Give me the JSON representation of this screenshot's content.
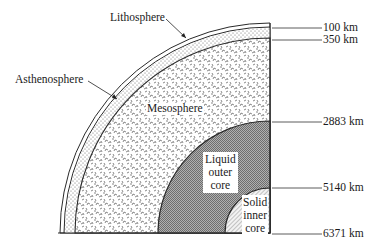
{
  "diagram": {
    "type": "earth-interior-cross-section-quadrant",
    "layers": [
      {
        "name": "Lithosphere",
        "depth_label": "100 km"
      },
      {
        "name": "Asthenosphere",
        "depth_label": "350 km"
      },
      {
        "name": "Mesosphere",
        "depth_label": "2883 km"
      },
      {
        "name": "Liquid outer core",
        "depth_label": "5140 km"
      },
      {
        "name": "Solid inner core",
        "depth_label": "6371 km"
      }
    ]
  },
  "labels": {
    "lithosphere": "Lithosphere",
    "asthenosphere": "Asthenosphere",
    "mesosphere": "Mesosphere",
    "outer_core": [
      "Liquid",
      "outer",
      "core"
    ],
    "inner_core": [
      "Solid",
      "inner",
      "core"
    ]
  },
  "depths": {
    "d100": "100 km",
    "d350": "350 km",
    "d2883": "2883 km",
    "d5140": "5140 km",
    "d6371": "6371 km"
  },
  "colors": {
    "line": "#2a2a2a",
    "outer_core_fill": "#9a9a9a",
    "inner_core_fill": "#e8e8e8"
  }
}
